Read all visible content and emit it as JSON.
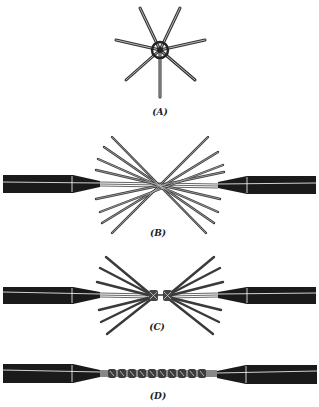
{
  "figure": {
    "panels": [
      {
        "id": "A",
        "label": "(A)",
        "description": "Strands of conductor fanned out in a star pattern, end view"
      },
      {
        "id": "B",
        "label": "(B)",
        "description": "Two cable ends with fanned strands interlaced"
      },
      {
        "id": "C",
        "label": "(C)",
        "description": "Strands beginning to be twisted together at the center"
      },
      {
        "id": "D",
        "label": "(D)",
        "description": "Completed twisted splice between two cable ends"
      }
    ]
  },
  "colors": {
    "background": "#ffffff",
    "insulation": "#1a1a1a",
    "strand": "#555555",
    "highlight": "#ffffff"
  }
}
